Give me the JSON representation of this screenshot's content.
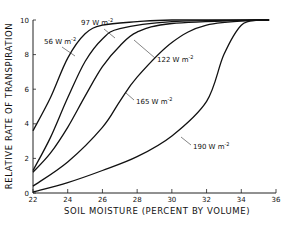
{
  "chart_data": {
    "type": "line",
    "title": "",
    "xlabel": "SOIL MOISTURE (PERCENT BY VOLUME)",
    "ylabel": "RELATIVE RATE OF TRANSPIRATION",
    "xlim": [
      22,
      36
    ],
    "ylim": [
      0,
      10
    ],
    "xticks": [
      22,
      24,
      26,
      28,
      30,
      32,
      34,
      36
    ],
    "yticks": [
      0,
      2,
      4,
      6,
      8,
      10
    ],
    "grid": false,
    "legend": "inline curve labels",
    "series": [
      {
        "name": "56 W m^-2",
        "label_text": "56",
        "unit": "W m",
        "exp": "-2",
        "points": [
          [
            22,
            3.6
          ],
          [
            23,
            5.5
          ],
          [
            24,
            7.8
          ],
          [
            25,
            9.2
          ],
          [
            26,
            9.7
          ],
          [
            28,
            9.9
          ],
          [
            30,
            10
          ],
          [
            35,
            10
          ]
        ]
      },
      {
        "name": "97 W m^-2",
        "label_text": "97",
        "unit": "W m",
        "exp": "-2",
        "points": [
          [
            22,
            1.3
          ],
          [
            23,
            3.2
          ],
          [
            24,
            5.5
          ],
          [
            25,
            7.6
          ],
          [
            26,
            8.9
          ],
          [
            27,
            9.5
          ],
          [
            30,
            9.9
          ],
          [
            35,
            10
          ]
        ]
      },
      {
        "name": "122 W m^-2",
        "label_text": "122",
        "unit": "W m",
        "exp": "-2",
        "points": [
          [
            22,
            1.2
          ],
          [
            23,
            2.3
          ],
          [
            24,
            3.8
          ],
          [
            25,
            5.6
          ],
          [
            26,
            7.3
          ],
          [
            27,
            8.5
          ],
          [
            28,
            9.3
          ],
          [
            30,
            9.8
          ],
          [
            35,
            10
          ]
        ]
      },
      {
        "name": "165 W m^-2",
        "label_text": "165",
        "unit": "W m",
        "exp": "-2",
        "points": [
          [
            22,
            0.4
          ],
          [
            24,
            1.8
          ],
          [
            26,
            3.8
          ],
          [
            27,
            5.3
          ],
          [
            28,
            6.7
          ],
          [
            30,
            8.7
          ],
          [
            32,
            9.7
          ],
          [
            35,
            10
          ]
        ]
      },
      {
        "name": "190 W m^-2",
        "label_text": "190",
        "unit": "W m",
        "exp": "-2",
        "points": [
          [
            22,
            0.05
          ],
          [
            24,
            0.6
          ],
          [
            26,
            1.3
          ],
          [
            28,
            2.1
          ],
          [
            30,
            3.3
          ],
          [
            32,
            5.3
          ],
          [
            33,
            8.0
          ],
          [
            34,
            9.7
          ],
          [
            35,
            10
          ]
        ]
      }
    ],
    "annotations": [
      {
        "series": 0,
        "text_x": 44,
        "text_y": 44,
        "leader": [
          [
            62,
            47
          ],
          [
            75,
            56
          ]
        ]
      },
      {
        "series": 1,
        "text_x": 81,
        "text_y": 25,
        "leader": [
          [
            104,
            29
          ],
          [
            115,
            38
          ]
        ]
      },
      {
        "series": 2,
        "text_x": 157,
        "text_y": 62,
        "leader": [
          [
            155,
            58
          ],
          [
            134,
            40
          ]
        ]
      },
      {
        "series": 3,
        "text_x": 136,
        "text_y": 104,
        "leader": [
          [
            134,
            100
          ],
          [
            126,
            93
          ]
        ]
      },
      {
        "series": 4,
        "text_x": 193,
        "text_y": 149,
        "leader": [
          [
            191,
            145
          ],
          [
            181,
            137
          ]
        ]
      }
    ]
  }
}
